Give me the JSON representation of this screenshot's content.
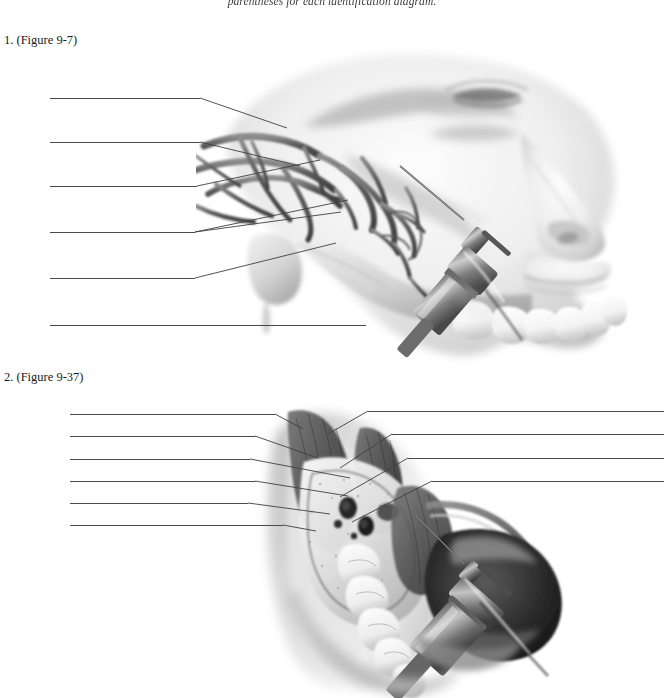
{
  "page": {
    "width": 664,
    "height": 698,
    "background": "#ffffff",
    "running_header": "parentheses for each identification diagram.",
    "ink_color": "#1c1c1c",
    "leader_line_color": "#4a4a4a"
  },
  "exercise": {
    "items": [
      {
        "number": "1.",
        "figure_reference": "(Figure 9-7)",
        "caption": "1.  (Figure 9-7)",
        "answer_lines_left": 6,
        "answer_lines_right": 0,
        "artwork": "lateral view of face and maxilla with dental syringe needle inserted for a posterior superior alveolar injection, showing pterygoid plexus of veins and maxillary artery"
      },
      {
        "number": "2.",
        "figure_reference": "(Figure 9-37)",
        "caption": "2.  (Figure 9-37)",
        "answer_lines_left": 6,
        "answer_lines_right": 4,
        "artwork": "cross-sectional view of mandible and oral cavity with dental syringe positioned for an inferior alveolar nerve block"
      }
    ]
  },
  "leader_lines": {
    "figure_1_left": [
      {
        "id": "f1-l1",
        "x1": 50,
        "y1": 98,
        "x2": 200,
        "y2": 98
      },
      {
        "id": "f1-l2",
        "x1": 50,
        "y1": 142,
        "x2": 200,
        "y2": 142
      },
      {
        "id": "f1-l3",
        "x1": 50,
        "y1": 186,
        "x2": 197,
        "y2": 186
      },
      {
        "id": "f1-l4",
        "x1": 50,
        "y1": 232,
        "x2": 195,
        "y2": 232
      },
      {
        "id": "f1-l5",
        "x1": 50,
        "y1": 278,
        "x2": 195,
        "y2": 278
      },
      {
        "id": "f1-l6",
        "x1": 50,
        "y1": 325,
        "x2": 366,
        "y2": 325
      }
    ],
    "figure_1_pointers": [
      {
        "id": "f1-p1",
        "x1": 200,
        "y1": 98,
        "x2": 287,
        "y2": 128
      },
      {
        "id": "f1-p2",
        "x1": 200,
        "y1": 142,
        "x2": 300,
        "y2": 166
      },
      {
        "id": "f1-p3",
        "x1": 197,
        "y1": 186,
        "x2": 320,
        "y2": 160
      },
      {
        "id": "f1-p4",
        "x1": 195,
        "y1": 232,
        "x2": 348,
        "y2": 200
      },
      {
        "id": "f1-p5",
        "x1": 195,
        "y1": 232,
        "x2": 341,
        "y2": 212
      },
      {
        "id": "f1-p6",
        "x1": 195,
        "y1": 278,
        "x2": 336,
        "y2": 243
      }
    ],
    "figure_2_left": [
      {
        "id": "f2-l1",
        "x1": 70,
        "y1": 414,
        "x2": 275,
        "y2": 414
      },
      {
        "id": "f2-l2",
        "x1": 70,
        "y1": 436,
        "x2": 255,
        "y2": 436
      },
      {
        "id": "f2-l3",
        "x1": 70,
        "y1": 459,
        "x2": 250,
        "y2": 459
      },
      {
        "id": "f2-l4",
        "x1": 70,
        "y1": 481,
        "x2": 255,
        "y2": 481
      },
      {
        "id": "f2-l5",
        "x1": 70,
        "y1": 503,
        "x2": 248,
        "y2": 503
      },
      {
        "id": "f2-l6",
        "x1": 70,
        "y1": 525,
        "x2": 283,
        "y2": 525
      }
    ],
    "figure_2_left_pointers": [
      {
        "id": "f2-p1",
        "x1": 275,
        "y1": 414,
        "x2": 303,
        "y2": 429
      },
      {
        "id": "f2-p2",
        "x1": 255,
        "y1": 436,
        "x2": 318,
        "y2": 458
      },
      {
        "id": "f2-p3",
        "x1": 250,
        "y1": 459,
        "x2": 350,
        "y2": 478
      },
      {
        "id": "f2-p4",
        "x1": 255,
        "y1": 481,
        "x2": 348,
        "y2": 496
      },
      {
        "id": "f2-p5",
        "x1": 248,
        "y1": 503,
        "x2": 330,
        "y2": 514
      },
      {
        "id": "f2-p6",
        "x1": 283,
        "y1": 525,
        "x2": 316,
        "y2": 531
      }
    ],
    "figure_2_right": [
      {
        "id": "f2-r1",
        "x1": 664,
        "y1": 411,
        "x2": 368,
        "y2": 411
      },
      {
        "id": "f2-r2",
        "x1": 664,
        "y1": 434,
        "x2": 392,
        "y2": 434
      },
      {
        "id": "f2-r3",
        "x1": 664,
        "y1": 458,
        "x2": 408,
        "y2": 458
      },
      {
        "id": "f2-r4",
        "x1": 664,
        "y1": 481,
        "x2": 432,
        "y2": 481
      }
    ],
    "figure_2_right_pointers": [
      {
        "id": "f2-rp1",
        "x1": 368,
        "y1": 411,
        "x2": 328,
        "y2": 434
      },
      {
        "id": "f2-rp2",
        "x1": 392,
        "y1": 434,
        "x2": 340,
        "y2": 468
      },
      {
        "id": "f2-rp3",
        "x1": 408,
        "y1": 458,
        "x2": 340,
        "y2": 497
      },
      {
        "id": "f2-rp4",
        "x1": 432,
        "y1": 481,
        "x2": 352,
        "y2": 522
      }
    ]
  }
}
